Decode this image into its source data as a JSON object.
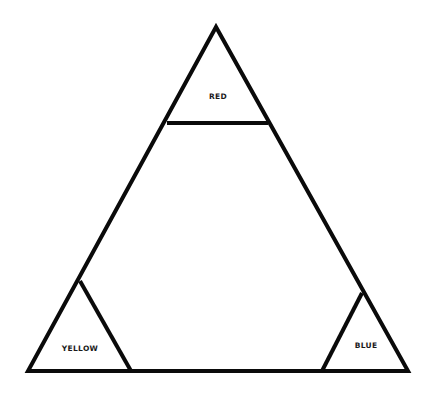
{
  "diagram": {
    "type": "color-triangle",
    "outer_triangle": {
      "apex": [
        216,
        27
      ],
      "bottom_left": [
        28,
        371
      ],
      "bottom_right": [
        408,
        371
      ]
    },
    "corner_regions": [
      {
        "id": "top",
        "label": "RED",
        "label_pos": [
          218,
          99
        ],
        "divider": [
          [
            167,
            123
          ],
          [
            268,
            123
          ]
        ]
      },
      {
        "id": "bottom-left",
        "label": "YELLOW",
        "label_pos": [
          80,
          351
        ],
        "divider": [
          [
            80,
            281
          ],
          [
            131,
            371
          ]
        ]
      },
      {
        "id": "bottom-right",
        "label": "BLUE",
        "label_pos": [
          366,
          348
        ],
        "divider": [
          [
            362,
            293
          ],
          [
            322,
            371
          ]
        ]
      }
    ],
    "stroke_color": "#0a0a0a",
    "background": "#ffffff"
  }
}
